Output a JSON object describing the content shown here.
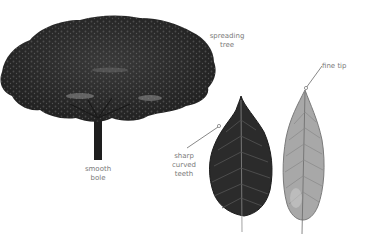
{
  "labels": {
    "tree_habit": "spreading\ntree",
    "trunk": "smooth\nbole",
    "leaf_margin": "sharp\ncurved\nteeth",
    "leaf_apex": "fine tip"
  },
  "illustrations": {
    "tree": "spreading-tree",
    "leaf_upper": "dark-leaf-upper-surface",
    "leaf_lower": "pale-leaf-underside"
  },
  "colors": {
    "background": "#ffffff",
    "foliage": "#2a2a2a",
    "trunk": "#1e1e1e",
    "dark_leaf": "#2b2b2b",
    "pale_leaf": "#a8a8a8",
    "label_text": "#7a7a7a",
    "leader_line": "#555555"
  }
}
